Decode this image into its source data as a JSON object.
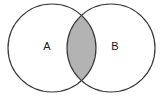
{
  "figure": {
    "name": "two-set-venn-diagram",
    "type": "venn",
    "width": 164,
    "height": 98,
    "background_color": "#ffffff",
    "stroke_color": "#3a3a3a",
    "stroke_width": 1.2
  },
  "sets": [
    {
      "id": "A",
      "label": "A",
      "label_x": 47,
      "label_y": 47,
      "center_x": 52,
      "center_y": 48,
      "radius": 44,
      "fill_color": "#ffffff"
    },
    {
      "id": "B",
      "label": "B",
      "label_x": 115,
      "label_y": 47,
      "center_x": 111,
      "center_y": 48,
      "radius": 44,
      "fill_color": "#ffffff"
    }
  ],
  "intersection": {
    "name": "a-intersect-b",
    "fill_color": "#b3b3b3",
    "shaded": true,
    "top_point_x": 81.5,
    "top_point_y": 12,
    "bottom_point_x": 81.5,
    "bottom_point_y": 84
  },
  "chart_data": {
    "type": "venn",
    "title": "",
    "categories": [
      "A",
      "B"
    ],
    "regions": [
      {
        "name": "A only",
        "label": "A",
        "shaded": false,
        "fill": "#ffffff"
      },
      {
        "name": "A ∩ B",
        "label": "",
        "shaded": true,
        "fill": "#b3b3b3"
      },
      {
        "name": "B only",
        "label": "B",
        "shaded": false,
        "fill": "#ffffff"
      }
    ],
    "legend": [],
    "annotations": [
      "A",
      "B"
    ],
    "grid": false
  }
}
